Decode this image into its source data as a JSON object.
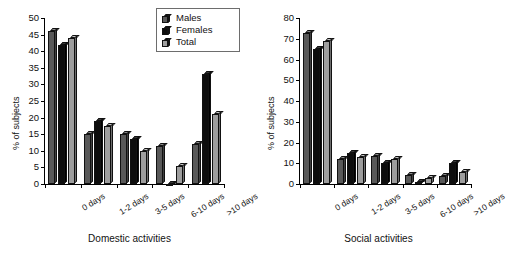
{
  "chart_data": [
    {
      "type": "bar",
      "title": "Domestic activities",
      "xlabel": "Domestic activities",
      "ylabel": "% of subjects",
      "categories": [
        "0 days",
        "1-2 days",
        "3-5 days",
        "6-10 days",
        ">10 days"
      ],
      "series": [
        {
          "name": "Males",
          "values": [
            46,
            15,
            15,
            11.5,
            12
          ]
        },
        {
          "name": "Females",
          "values": [
            42,
            19,
            13.5,
            0,
            33
          ]
        },
        {
          "name": "Total",
          "values": [
            44,
            17.5,
            10,
            5.5,
            21
          ]
        }
      ],
      "ylim": [
        0,
        50
      ],
      "yticks": [
        0,
        5,
        10,
        15,
        20,
        25,
        30,
        35,
        40,
        45,
        50
      ],
      "grid": false,
      "legend_position": "top-center"
    },
    {
      "type": "bar",
      "title": "Social activities",
      "xlabel": "Social activities",
      "ylabel": "% of subjects",
      "categories": [
        "0 days",
        "1-2 days",
        "3-5 days",
        "6-10 days",
        ">10 days"
      ],
      "series": [
        {
          "name": "Males",
          "values": [
            73,
            12,
            13.5,
            4.5,
            4
          ]
        },
        {
          "name": "Females",
          "values": [
            65,
            15,
            10,
            1,
            10
          ]
        },
        {
          "name": "Total",
          "values": [
            69,
            13,
            12,
            3,
            6
          ]
        }
      ],
      "ylim": [
        0,
        80
      ],
      "yticks": [
        0,
        10,
        20,
        30,
        40,
        50,
        60,
        70,
        80
      ],
      "grid": false,
      "legend_position": "none"
    }
  ],
  "legend": {
    "items": [
      {
        "label": "Males",
        "color": "#595959"
      },
      {
        "label": "Females",
        "color": "#0d0d0d"
      },
      {
        "label": "Total",
        "color": "#9e9e9e"
      }
    ]
  }
}
